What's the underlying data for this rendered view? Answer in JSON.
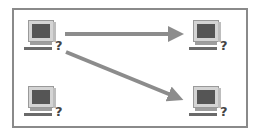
{
  "diagram": {
    "nodes": [
      {
        "id": "top-left",
        "icon": "computer-icon",
        "mark": "?",
        "x": 24,
        "y": 20
      },
      {
        "id": "top-right",
        "icon": "computer-icon",
        "mark": "?",
        "x": 189,
        "y": 20
      },
      {
        "id": "bottom-left",
        "icon": "computer-icon",
        "mark": "?",
        "x": 24,
        "y": 86
      },
      {
        "id": "bottom-right",
        "icon": "computer-icon",
        "mark": "?",
        "x": 189,
        "y": 86
      }
    ],
    "edges": [
      {
        "from": "top-left",
        "to": "top-right"
      },
      {
        "from": "top-left",
        "to": "bottom-right"
      }
    ],
    "colors": {
      "border": "#8a8a8a",
      "arrow": "#8c8c8c",
      "screen": "#555555"
    }
  }
}
